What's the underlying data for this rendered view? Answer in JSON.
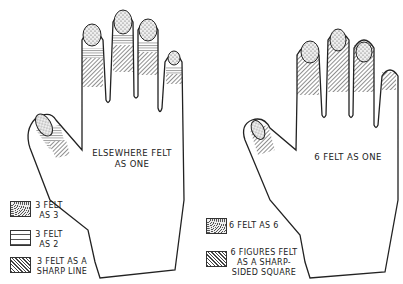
{
  "left_hand": {
    "center_label": "ELSEWHERE FELT AS ONE",
    "legend": [
      {
        "pattern": "stipple",
        "label": "3 FELT AS 3"
      },
      {
        "pattern": "horizontal-lines",
        "label": "3 FELT AS 2"
      },
      {
        "pattern": "diagonal-hatch",
        "label": "3 FELT AS A SHARP LINE"
      }
    ]
  },
  "right_hand": {
    "center_label": "6 FELT AS ONE",
    "legend": [
      {
        "pattern": "stipple",
        "label": "6 FELT AS 6"
      },
      {
        "pattern": "diagonal-hatch",
        "label": "6 FIGURES FELT AS A SHARP-SIDED SQUARE"
      }
    ]
  },
  "colors": {
    "line": "#222222",
    "fill": "#ffffff"
  }
}
